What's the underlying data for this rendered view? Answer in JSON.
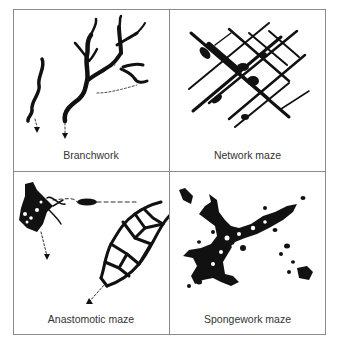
{
  "figure": {
    "panels": [
      {
        "id": "branchwork",
        "label": "Branchwork"
      },
      {
        "id": "network",
        "label": "Network maze"
      },
      {
        "id": "anastomotic",
        "label": "Anastomotic maze"
      },
      {
        "id": "spongework",
        "label": "Spongework maze"
      }
    ],
    "colors": {
      "ink": "#111111",
      "border": "#8a8a8a",
      "text": "#333333"
    }
  }
}
